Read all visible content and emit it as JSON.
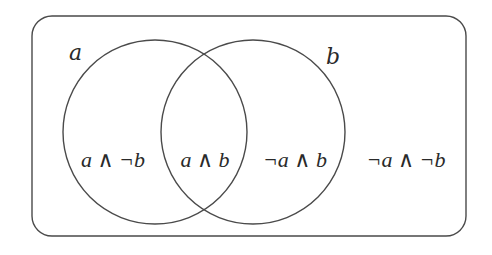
{
  "diagram": {
    "type": "venn",
    "universe": {
      "name": "universe"
    },
    "sets": [
      {
        "id": "a",
        "label": "a"
      },
      {
        "id": "b",
        "label": "b"
      }
    ],
    "regions": [
      {
        "id": "a-only",
        "label": "a ∧ ¬b"
      },
      {
        "id": "a-and-b",
        "label": "a ∧ b"
      },
      {
        "id": "b-only",
        "label": "¬a ∧ b"
      },
      {
        "id": "neither",
        "label": "¬a ∧ ¬b"
      }
    ],
    "stroke_color": "#4a4a4a",
    "text_color": "#2a2a2a"
  }
}
